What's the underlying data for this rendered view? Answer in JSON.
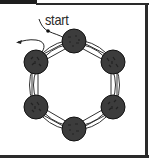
{
  "diagram": {
    "type": "ring-of-nodes",
    "label": {
      "text": "start",
      "x": 45,
      "y": 13
    },
    "colors": {
      "node_fill": "#3c3c3c",
      "node_stroke": "#111111",
      "ring_stroke": "#333333",
      "frame": "#1e1e1e",
      "background": "#ffffff"
    },
    "nodes": [
      {
        "id": "n1",
        "position": "top",
        "cx": 74,
        "cy": 41,
        "r": 12
      },
      {
        "id": "n2",
        "position": "upper-right",
        "cx": 113,
        "cy": 62,
        "r": 12
      },
      {
        "id": "n3",
        "position": "lower-right",
        "cx": 113,
        "cy": 107,
        "r": 12
      },
      {
        "id": "n4",
        "position": "bottom",
        "cx": 74,
        "cy": 129,
        "r": 12
      },
      {
        "id": "n5",
        "position": "lower-left",
        "cx": 36,
        "cy": 107,
        "r": 12
      },
      {
        "id": "n6",
        "position": "upper-left",
        "cx": 36,
        "cy": 62,
        "r": 12
      }
    ],
    "ring": {
      "cx": 74.5,
      "cy": 85,
      "inner_r": 41,
      "outer_r": 45
    },
    "arrows": [
      {
        "name": "entry-path",
        "description": "curve from start label via dot into top node"
      },
      {
        "name": "exit-path",
        "description": "curve leaving upper-left node, arrowhead pointing left"
      }
    ]
  }
}
